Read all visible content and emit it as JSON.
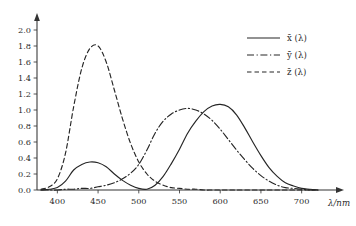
{
  "chart_data": {
    "type": "line",
    "title": "",
    "xlabel": "λ/nm",
    "ylabel": "",
    "xlim": [
      375,
      725
    ],
    "ylim": [
      0.0,
      2.1
    ],
    "grid": false,
    "legend_position": "top-right",
    "xticks": [
      400,
      450,
      500,
      550,
      600,
      650,
      700
    ],
    "yticks": [
      "0.0",
      "0.2",
      "0.4",
      "0.6",
      "0.8",
      "1.0",
      "1.2",
      "1.4",
      "1.6",
      "1.8",
      "2.0"
    ],
    "x": [
      380,
      390,
      400,
      410,
      420,
      430,
      440,
      450,
      460,
      470,
      480,
      490,
      500,
      510,
      520,
      530,
      540,
      550,
      560,
      570,
      580,
      590,
      600,
      610,
      620,
      630,
      640,
      650,
      660,
      670,
      680,
      690,
      700,
      710,
      720
    ],
    "series": [
      {
        "name": "x̄ (λ)",
        "label": "x",
        "style": "solid",
        "peak_value": 1.07,
        "peak_x": 600,
        "secondary_peak_value": 0.35,
        "secondary_peak_x": 442,
        "values": [
          0.0,
          0.01,
          0.03,
          0.11,
          0.25,
          0.32,
          0.35,
          0.34,
          0.29,
          0.2,
          0.12,
          0.06,
          0.02,
          0.01,
          0.06,
          0.17,
          0.33,
          0.51,
          0.71,
          0.86,
          0.98,
          1.05,
          1.07,
          1.04,
          0.94,
          0.78,
          0.6,
          0.43,
          0.28,
          0.17,
          0.09,
          0.05,
          0.02,
          0.01,
          0.0
        ]
      },
      {
        "name": "ȳ (λ)",
        "label": "y",
        "style": "dash-dot",
        "peak_value": 1.02,
        "peak_x": 555,
        "values": [
          0.0,
          0.0,
          0.0,
          0.01,
          0.01,
          0.02,
          0.02,
          0.04,
          0.06,
          0.09,
          0.14,
          0.21,
          0.32,
          0.5,
          0.71,
          0.86,
          0.95,
          1.0,
          1.02,
          1.0,
          0.95,
          0.87,
          0.76,
          0.63,
          0.5,
          0.38,
          0.27,
          0.18,
          0.11,
          0.06,
          0.03,
          0.02,
          0.01,
          0.0,
          0.0
        ]
      },
      {
        "name": "z̄ (λ)",
        "label": "z",
        "style": "dashed",
        "peak_value": 1.8,
        "peak_x": 445,
        "values": [
          0.01,
          0.04,
          0.14,
          0.46,
          1.04,
          1.52,
          1.77,
          1.8,
          1.6,
          1.25,
          0.89,
          0.58,
          0.35,
          0.2,
          0.11,
          0.06,
          0.03,
          0.02,
          0.01,
          0.01,
          0.0,
          0.0,
          0.0,
          0.0,
          0.0,
          0.0,
          0.0,
          0.0,
          0.0,
          0.0,
          0.0,
          0.0,
          0.0,
          0.0,
          0.0
        ]
      }
    ]
  },
  "axis": {
    "x_axis_name": "λ/nm",
    "x_arrow": true,
    "y_arrow": true
  },
  "legend": {
    "entries": [
      {
        "text": "x̄ (λ)",
        "style": "solid"
      },
      {
        "text": "ȳ (λ)",
        "style": "dash-dot"
      },
      {
        "text": "z̄ (λ)",
        "style": "dashed"
      }
    ]
  }
}
